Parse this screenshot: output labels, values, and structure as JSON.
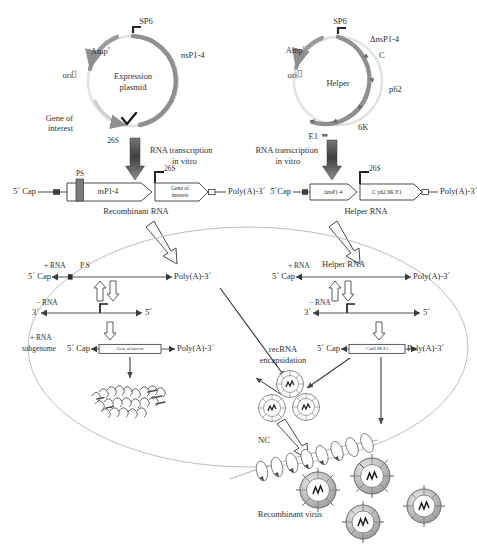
{
  "figure": {
    "colors": {
      "plasmid_arc": "#8f8f8f",
      "plasmid_backbone": "#d6d6d6",
      "outline": "#4a4a4a",
      "text": "#2f2f2f",
      "cell_membrane": "#b9b9b9",
      "dark_fill": "#5a5a5a"
    }
  },
  "left_plasmid": {
    "name_line1": "Expression",
    "name_line2": "plasmid",
    "promoter": "SP6",
    "insert_label": "nsP1-4",
    "amp": "Amp",
    "amp_sup": "r",
    "ori": "ori",
    "gene_line1": "Gene of",
    "gene_line2": "interest",
    "subgenomic_promoter": "26S"
  },
  "right_plasmid": {
    "name": "Helper",
    "promoter": "SP6",
    "amp": "Amp",
    "amp_sup": "r",
    "ori": "ori",
    "genes": [
      "ΔnsP1-4",
      "C",
      "p62",
      "6K",
      "E1"
    ]
  },
  "transcription": {
    "left_line1": "RNA transcription",
    "left_line2": "in vitro",
    "right_line1": "RNA transcription",
    "right_line2": "in vitro"
  },
  "recombinant_rna": {
    "caption": "Recombinant RNA",
    "cap": "5´ Cap",
    "packaging_signal": "PS",
    "orf1": "nsP1-4",
    "promoter": "26S",
    "gene_line1": "Gene of",
    "gene_line2": "interest",
    "polya": "Poly(A)-3´"
  },
  "helper_rna": {
    "caption": "Helper RNA",
    "cap": "5´Cap",
    "orf1": "ΔnsP1-4",
    "promoter": "26S",
    "structural": "C p62 6K E1",
    "polya": "Poly(A)-3´"
  },
  "cell_left": {
    "plus_strand": {
      "label": "+ RNA",
      "name": "P S",
      "cap": "5´ Cap",
      "polya": "Poly(A)-3´"
    },
    "minus_strand": {
      "label": "− RNA",
      "three_prime": "3´",
      "five_prime": "5´"
    },
    "subgenome": {
      "label_line1": "+ RNA",
      "label_line2": "subgenome",
      "cap": "5´ Cap",
      "gene": "Gene of interest",
      "polya": "Poly(A)-3´"
    }
  },
  "cell_right": {
    "plus_strand": {
      "label": "+ RNA",
      "name": "Helper RNA",
      "cap": "5´ Cap",
      "polya": "Poly(A)-3´"
    },
    "minus_strand": {
      "label": "− RNA",
      "three_prime": "3´",
      "five_prime": "5´"
    },
    "subgenome": {
      "cap": "5´ Cap",
      "gene": "C p62 6K E1",
      "polya": "Poly(A)-3´"
    }
  },
  "encapsidation": {
    "label_line1": "recRNA",
    "label_line2": "encapsidation",
    "nucleocapsid": "NC"
  },
  "output": {
    "label": "Recombinant virus"
  }
}
